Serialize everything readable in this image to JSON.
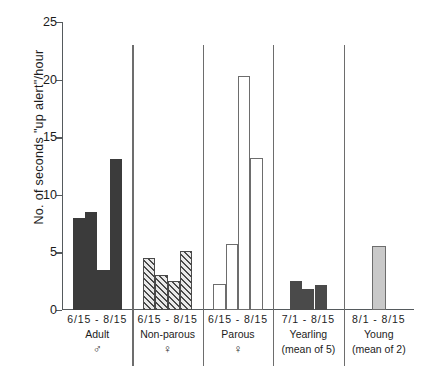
{
  "chart_data": {
    "type": "bar",
    "title": "",
    "xlabel": "",
    "ylabel": "No. of seconds \"up alert\"/hour",
    "ylim": [
      0,
      25
    ],
    "yticks": [
      0,
      5,
      10,
      15,
      20,
      25
    ],
    "grid": false,
    "legend": "none",
    "groups": [
      {
        "range": "6/15 - 8/15",
        "name": "Adult",
        "symbol": "♂",
        "sub": "",
        "fill": "solid-dark",
        "values": [
          8.0,
          8.5,
          3.5,
          13.1
        ]
      },
      {
        "range": "6/15 - 8/15",
        "name": "Non-parous",
        "symbol": "♀",
        "sub": "",
        "fill": "hatch",
        "values": [
          4.5,
          3.0,
          2.5,
          5.1
        ]
      },
      {
        "range": "6/15 - 8/15",
        "name": "Parous",
        "symbol": "♀",
        "sub": "",
        "fill": "open",
        "values": [
          2.3,
          5.7,
          20.3,
          13.2
        ]
      },
      {
        "range": "7/1 - 8/15",
        "name": "Yearling",
        "symbol": "",
        "sub": "(mean of 5)",
        "fill": "solid-mid",
        "values": [
          2.5,
          1.8,
          2.2
        ]
      },
      {
        "range": "8/1 - 8/15",
        "name": "Young",
        "symbol": "",
        "sub": "(mean of 2)",
        "fill": "light",
        "values": [
          5.6
        ]
      }
    ]
  }
}
